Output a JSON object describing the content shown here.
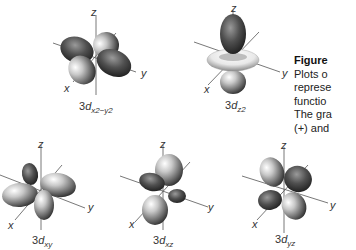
{
  "figure": {
    "caption": {
      "title": "Figure",
      "lines": [
        "Plots o",
        "represe",
        "functio",
        "The gra",
        "(+) and"
      ]
    },
    "orbitals": [
      {
        "name": "3d_x2-y2",
        "prefix": "3",
        "d": "d",
        "subscript": "x2−y2",
        "axes": {
          "z": "z",
          "x": "x",
          "y": "y"
        }
      },
      {
        "name": "3d_z2",
        "prefix": "3",
        "d": "d",
        "subscript": "z2",
        "axes": {
          "z": "z",
          "x": "x",
          "y": "y"
        }
      },
      {
        "name": "3d_xy",
        "prefix": "3",
        "d": "d",
        "subscript": "xy",
        "axes": {
          "z": "z",
          "x": "x",
          "y": "y"
        }
      },
      {
        "name": "3d_xz",
        "prefix": "3",
        "d": "d",
        "subscript": "xz",
        "axes": {
          "z": "z",
          "x": "x",
          "y": "y"
        }
      },
      {
        "name": "3d_yz",
        "prefix": "3",
        "d": "d",
        "subscript": "yz",
        "axes": {
          "z": "z",
          "x": "x",
          "y": "y"
        }
      }
    ],
    "colors": {
      "lobe_dark": "#3a3a3a",
      "lobe_light": "#f4f4f4",
      "axis": "#555555",
      "text": "#333333"
    }
  }
}
